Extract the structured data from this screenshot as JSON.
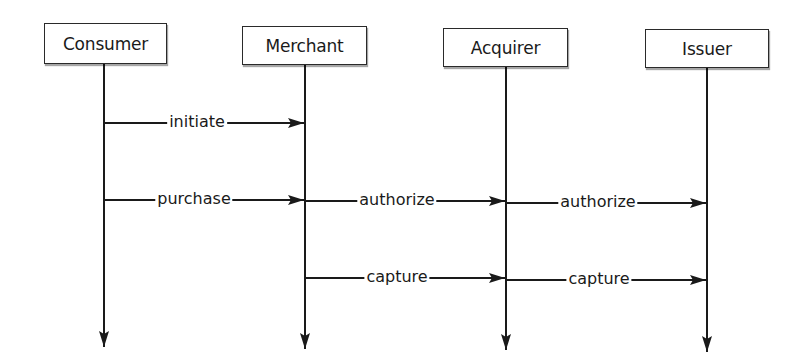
{
  "diagram": {
    "type": "sequence",
    "colors": {
      "line": "#1a1a1a",
      "box_border": "#2a2a2a",
      "background": "#ffffff"
    },
    "actors": [
      {
        "id": "consumer",
        "label": "Consumer",
        "box": {
          "x": 44,
          "y": 23,
          "w": 123,
          "h": 41
        },
        "lifeline_x": 104,
        "lifeline_end_y": 347
      },
      {
        "id": "merchant",
        "label": "Merchant",
        "box": {
          "x": 242,
          "y": 26,
          "w": 125,
          "h": 39
        },
        "lifeline_x": 305,
        "lifeline_end_y": 349
      },
      {
        "id": "acquirer",
        "label": "Acquirer",
        "box": {
          "x": 443,
          "y": 28,
          "w": 125,
          "h": 39
        },
        "lifeline_x": 506,
        "lifeline_end_y": 350
      },
      {
        "id": "issuer",
        "label": "Issuer",
        "box": {
          "x": 645,
          "y": 29,
          "w": 124,
          "h": 39
        },
        "lifeline_x": 707,
        "lifeline_end_y": 352
      }
    ],
    "messages": [
      {
        "label": "initiate",
        "from": "Consumer",
        "to": "Merchant",
        "y": 123,
        "label_x": 197
      },
      {
        "label": "purchase",
        "from": "Consumer",
        "to": "Merchant",
        "y": 200,
        "label_x": 194
      },
      {
        "label": "authorize",
        "from": "Merchant",
        "to": "Acquirer",
        "y": 201,
        "label_x": 397
      },
      {
        "label": "authorize",
        "from": "Acquirer",
        "to": "Issuer",
        "y": 203,
        "label_x": 598
      },
      {
        "label": "capture",
        "from": "Merchant",
        "to": "Acquirer",
        "y": 278,
        "label_x": 397
      },
      {
        "label": "capture",
        "from": "Acquirer",
        "to": "Issuer",
        "y": 280,
        "label_x": 599
      }
    ]
  }
}
